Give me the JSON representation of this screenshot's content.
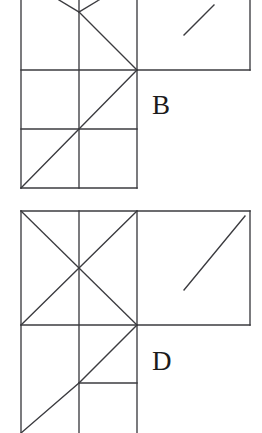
{
  "page": {
    "width": 262,
    "height": 433,
    "background_color": "#ffffff",
    "stroke_color": "#3b3b3f",
    "label_color": "#1b1b1b",
    "stroke_width": 1.35
  },
  "figures": [
    {
      "id": "figure-b",
      "label": "B",
      "label_position": {
        "x": 152,
        "y": 114
      },
      "description": "Upper L-shaped tangram-like diagram, top portion cropped by image edge",
      "segments": [
        {
          "name": "left-outer-vertical",
          "x1": 21,
          "y1": 0,
          "x2": 21,
          "y2": 188
        },
        {
          "name": "middle-vertical",
          "x1": 79,
          "y1": 0,
          "x2": 79,
          "y2": 188
        },
        {
          "name": "right-vertical",
          "x1": 137,
          "y1": 0,
          "x2": 137,
          "y2": 188
        },
        {
          "name": "far-right-vertical",
          "x1": 250,
          "y1": 0,
          "x2": 250,
          "y2": 70
        },
        {
          "name": "horizontal-upper",
          "x1": 21,
          "y1": 70,
          "x2": 250,
          "y2": 70
        },
        {
          "name": "horizontal-middle",
          "x1": 21,
          "y1": 129,
          "x2": 137,
          "y2": 129
        },
        {
          "name": "horizontal-bottom",
          "x1": 21,
          "y1": 188,
          "x2": 137,
          "y2": 188
        },
        {
          "name": "diag-upper-left-v",
          "x1": 59,
          "y1": 0,
          "x2": 79,
          "y2": 12
        },
        {
          "name": "diag-upper-right-v",
          "x1": 99,
          "y1": 0,
          "x2": 79,
          "y2": 12
        },
        {
          "name": "diag-down-to-node",
          "x1": 79,
          "y1": 12,
          "x2": 137,
          "y2": 70
        },
        {
          "name": "diag-node-to-mid",
          "x1": 137,
          "y1": 70,
          "x2": 79,
          "y2": 129
        },
        {
          "name": "diag-mid-to-corner",
          "x1": 79,
          "y1": 129,
          "x2": 21,
          "y2": 188
        },
        {
          "name": "diag-right-panel",
          "x1": 184,
          "y1": 35,
          "x2": 214,
          "y2": 5
        }
      ]
    },
    {
      "id": "figure-d",
      "label": "D",
      "label_position": {
        "x": 152,
        "y": 370
      },
      "description": "Lower L-shaped tangram-like diagram, bottom portion cropped by image edge",
      "segments": [
        {
          "name": "left-outer-vertical",
          "x1": 21,
          "y1": 211,
          "x2": 21,
          "y2": 433
        },
        {
          "name": "middle-vertical",
          "x1": 79,
          "y1": 211,
          "x2": 79,
          "y2": 433
        },
        {
          "name": "right-vertical",
          "x1": 137,
          "y1": 211,
          "x2": 137,
          "y2": 433
        },
        {
          "name": "far-right-vertical",
          "x1": 250,
          "y1": 211,
          "x2": 250,
          "y2": 325
        },
        {
          "name": "top-horizontal",
          "x1": 21,
          "y1": 211,
          "x2": 250,
          "y2": 211
        },
        {
          "name": "horizontal-node-row",
          "x1": 21,
          "y1": 325,
          "x2": 250,
          "y2": 325
        },
        {
          "name": "horizontal-short",
          "x1": 79,
          "y1": 383,
          "x2": 137,
          "y2": 383
        },
        {
          "name": "diag-square-main",
          "x1": 21,
          "y1": 211,
          "x2": 137,
          "y2": 325
        },
        {
          "name": "diag-square-anti",
          "x1": 137,
          "y1": 211,
          "x2": 21,
          "y2": 325
        },
        {
          "name": "diag-node-to-mid",
          "x1": 137,
          "y1": 325,
          "x2": 79,
          "y2": 383
        },
        {
          "name": "diag-mid-to-bottom",
          "x1": 79,
          "y1": 383,
          "x2": 21,
          "y2": 433
        },
        {
          "name": "diag-right-panel",
          "x1": 184,
          "y1": 290,
          "x2": 245,
          "y2": 216
        }
      ]
    }
  ]
}
